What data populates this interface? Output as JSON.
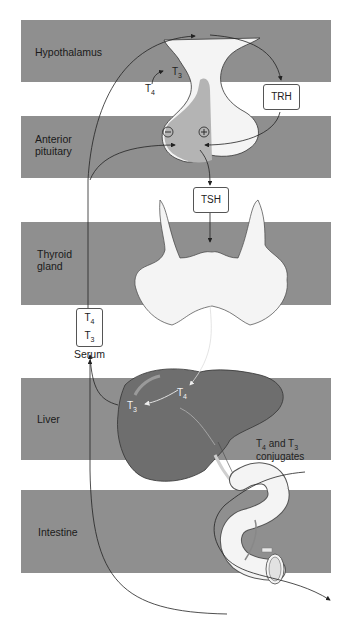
{
  "diagram": {
    "regions": [
      {
        "id": "hypothalamus",
        "label": "Hypothalamus"
      },
      {
        "id": "pituitary",
        "label_line1": "Anterior",
        "label_line2": "pituitary"
      },
      {
        "id": "thyroid",
        "label_line1": "Thyroid",
        "label_line2": "gland"
      },
      {
        "id": "liver",
        "label": "Liver"
      },
      {
        "id": "intestine",
        "label": "Intestine"
      }
    ],
    "boxes": {
      "trh": "TRH",
      "tsh": "TSH",
      "serum_t4": "T",
      "serum_t4_sub": "4",
      "serum_t3": "T",
      "serum_t3_sub": "3"
    },
    "labels": {
      "serum": "Serum",
      "hypo_t4": "T",
      "hypo_t4_sub": "4",
      "hypo_t3": "T",
      "hypo_t3_sub": "3",
      "liver_t4": "T",
      "liver_t4_sub": "4",
      "liver_t3": "T",
      "liver_t3_sub": "3",
      "conj_line1_a": "T",
      "conj_line1_a_sub": "4",
      "conj_line1_b": " and T",
      "conj_line1_b_sub": "3",
      "conj_line2": "conjugates",
      "minus": "−",
      "plus": "+"
    },
    "colors": {
      "band": "#8f8f8f",
      "liver": "#6e6e6e",
      "organ_light": "#f2f2f2",
      "line": "#222222"
    }
  }
}
